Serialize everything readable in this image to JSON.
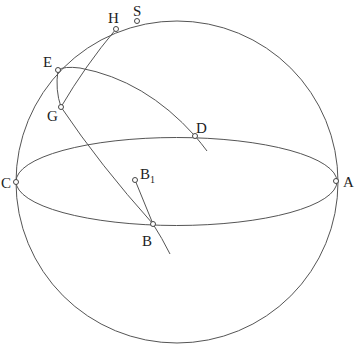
{
  "diagram": {
    "type": "sphere-geometry",
    "sphere": {
      "cx": 177,
      "cy": 182,
      "r": 161
    },
    "equator": {
      "cx": 176.5,
      "cy": 181,
      "rx": 160.5,
      "ry": 44
    },
    "stroke_color": "#555555",
    "points": [
      {
        "id": "A",
        "label": "A",
        "x": 336,
        "y": 181,
        "lx": 345,
        "ly": 187
      },
      {
        "id": "B",
        "label": "B",
        "x": 153,
        "y": 224,
        "lx": 140,
        "ly": 246
      },
      {
        "id": "B1",
        "label": "B",
        "sub": "1",
        "x": 135,
        "y": 180,
        "lx": 141,
        "ly": 178
      },
      {
        "id": "C",
        "label": "C",
        "x": 16,
        "y": 182,
        "lx": 1,
        "ly": 188
      },
      {
        "id": "D",
        "label": "D",
        "x": 195,
        "y": 136,
        "lx": 197,
        "ly": 132
      },
      {
        "id": "E",
        "label": "E",
        "x": 58,
        "y": 70,
        "lx": 43,
        "ly": 67
      },
      {
        "id": "G",
        "label": "G",
        "x": 61,
        "y": 107,
        "lx": 47,
        "ly": 120
      },
      {
        "id": "H",
        "label": "H",
        "x": 116,
        "y": 29,
        "lx": 108,
        "ly": 23
      },
      {
        "id": "S",
        "label": "S",
        "x": 137,
        "y": 21,
        "lx": 133,
        "ly": 15
      }
    ],
    "labels": {
      "A": "A",
      "B": "B",
      "B1_main": "B",
      "B1_sub": "1",
      "C": "C",
      "D": "D",
      "E": "E",
      "G": "G",
      "H": "H",
      "S": "S"
    }
  }
}
